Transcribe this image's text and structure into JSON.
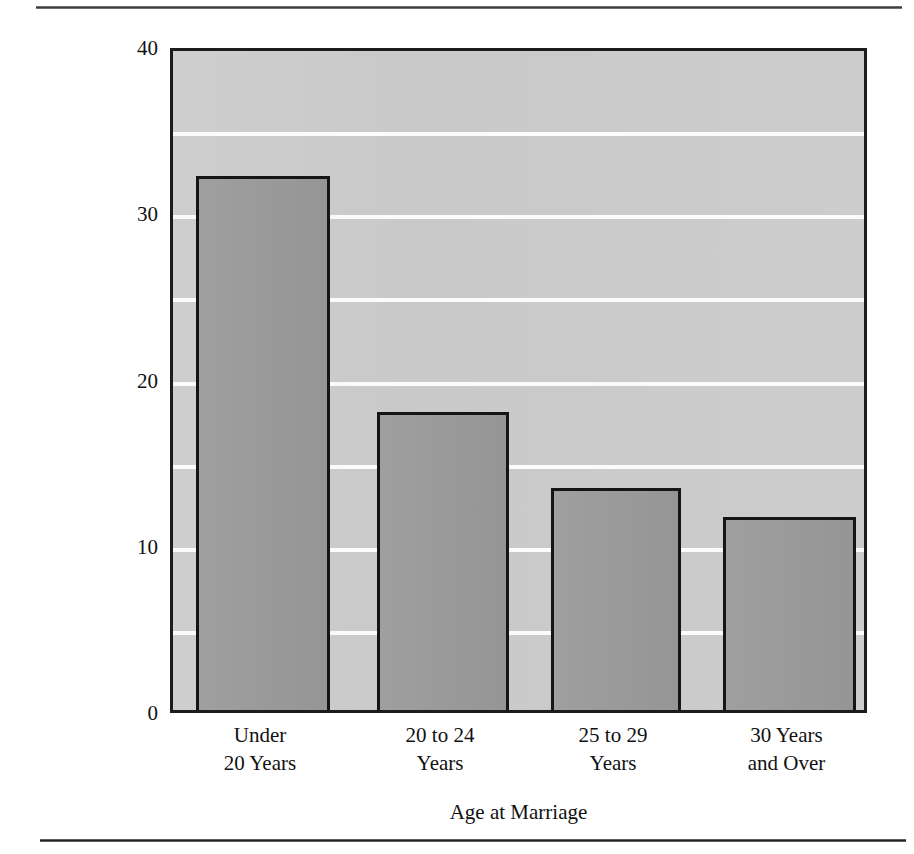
{
  "chart_data": {
    "type": "bar",
    "title": "",
    "xlabel": "Age at Marriage",
    "ylabel": "Percent of U.S. Women Divorced",
    "categories": [
      "Under 20 Years",
      "20 to 24 Years",
      "25 to 29 Years",
      "30 Years and Over"
    ],
    "category_lines": [
      [
        "Under",
        "20 Years"
      ],
      [
        "20 to 24",
        "Years"
      ],
      [
        "25 to 29",
        "Years"
      ],
      [
        "30 Years",
        "and Over"
      ]
    ],
    "values": [
      32.5,
      18.3,
      13.7,
      12.0
    ],
    "ylim": [
      0,
      40
    ],
    "xlim_note": "categorical",
    "ytick_labels": [
      "0",
      "10",
      "20",
      "30",
      "40"
    ],
    "ytick_values": [
      0,
      10,
      20,
      30,
      40
    ],
    "gridline_values": [
      5,
      10,
      15,
      20,
      25,
      30,
      35
    ],
    "grid": true,
    "grid_color": "#fbfbfb",
    "legend": "none",
    "colors": {
      "bar_fill": "#9a9a9a",
      "bar_edge": "#151515",
      "plot_background": "#c9c9c9",
      "frame": "#1c1c1c",
      "page_background": "#ffffff",
      "text": "#111111",
      "rule": "#3d3d3d"
    }
  },
  "figure": {
    "rule_top": "",
    "rule_bottom": ""
  }
}
